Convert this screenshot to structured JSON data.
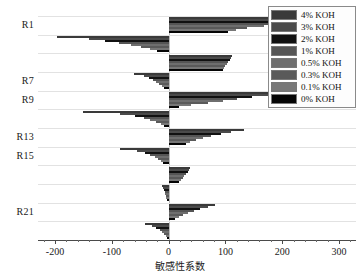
{
  "chart_data": {
    "type": "bar",
    "orientation": "horizontal",
    "title": "",
    "xlabel": "敏感性系数",
    "ylabel": "",
    "xlim": [
      -230,
      330
    ],
    "xticks": [
      -200,
      -100,
      0,
      100,
      200,
      300
    ],
    "xticklabels": [
      "-200",
      "-100",
      "0",
      "100",
      "200",
      "300"
    ],
    "grid": true,
    "legend_position": "top-right",
    "categories": [
      "R1",
      "R3",
      "R5",
      "R7",
      "R9",
      "R11",
      "R13",
      "R15",
      "R17",
      "R19",
      "R21",
      "R23"
    ],
    "visible_tick_labels": [
      "R21",
      "R15",
      "R13",
      "R9",
      "R7",
      "R1"
    ],
    "series": [
      {
        "name": "4% KOH",
        "color": "#3a3a3a",
        "values": [
          308,
          -196,
          112,
          -61,
          240,
          -150,
          132,
          -86,
          38,
          -11,
          82,
          -42
        ]
      },
      {
        "name": "3% KOH",
        "color": "#4a4a4a",
        "values": [
          289,
          -140,
          110,
          -44,
          200,
          -86,
          110,
          -56,
          36,
          -9,
          70,
          -30
        ]
      },
      {
        "name": "2% KOH",
        "color": "#111111",
        "values": [
          252,
          -112,
          108,
          -35,
          146,
          -60,
          92,
          -42,
          34,
          -8,
          56,
          -22
        ]
      },
      {
        "name": "1% KOH",
        "color": "#555555",
        "values": [
          210,
          -88,
          105,
          -28,
          120,
          -44,
          74,
          -32,
          31,
          -7,
          44,
          -16
        ]
      },
      {
        "name": "0.5% KOH",
        "color": "#6e6e6e",
        "values": [
          168,
          -66,
          102,
          -22,
          96,
          -32,
          60,
          -24,
          28,
          -6,
          34,
          -11
        ]
      },
      {
        "name": "0.3% KOH",
        "color": "#5a5a5a",
        "values": [
          138,
          -48,
          100,
          -17,
          70,
          -22,
          48,
          -18,
          25,
          -5,
          26,
          -8
        ]
      },
      {
        "name": "0.1% KOH",
        "color": "#777777",
        "values": [
          118,
          -32,
          98,
          -12,
          40,
          -14,
          38,
          -13,
          22,
          -4,
          18,
          -5
        ]
      },
      {
        "name": "0% KOH",
        "color": "#050505",
        "values": [
          104,
          -20,
          96,
          -8,
          18,
          -8,
          30,
          -9,
          19,
          -3,
          12,
          -3
        ]
      }
    ]
  },
  "legend": {
    "items": [
      {
        "label": "4% KOH"
      },
      {
        "label": "3% KOH"
      },
      {
        "label": "2% KOH"
      },
      {
        "label": "1% KOH"
      },
      {
        "label": "0.5% KOH"
      },
      {
        "label": "0.3% KOH"
      },
      {
        "label": "0.1% KOH"
      },
      {
        "label": "0% KOH"
      }
    ]
  }
}
